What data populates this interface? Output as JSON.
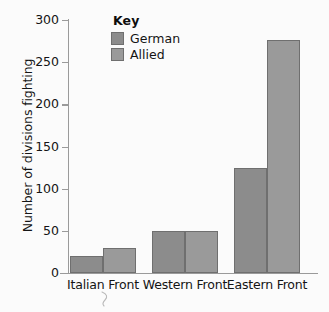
{
  "chart_data": {
    "type": "bar",
    "title": "",
    "subtitle": "",
    "xlabel": "",
    "ylabel": "Number of divisions fighting",
    "categories": [
      "Italian Front",
      "Western Front",
      "Eastern Front"
    ],
    "series": [
      {
        "name": "German",
        "color": "#8c8c8c",
        "values": [
          20,
          50,
          125
        ]
      },
      {
        "name": "Allied",
        "color": "#9a9a9a",
        "values": [
          30,
          50,
          276
        ]
      }
    ],
    "ylim": [
      0,
      300
    ],
    "ytick_values": [
      0,
      50,
      100,
      150,
      200,
      250,
      300
    ],
    "ytick_labels": [
      "0",
      "50",
      "100",
      "150",
      "200",
      "250",
      "300"
    ],
    "grid": false,
    "legend_position": "top-center",
    "legend_title": "Key",
    "bar_border_color": "#6f6f6f",
    "axis_color": "#9a9a9a",
    "background_color": "#fbfbfb",
    "text_color": "#141414"
  },
  "legend": {
    "title": "Key",
    "entries": [
      {
        "label": "German",
        "color": "#8c8c8c"
      },
      {
        "label": "Allied",
        "color": "#9a9a9a"
      }
    ]
  },
  "axes": {
    "y_title": "Number of divisions fighting",
    "y_ticks": [
      "300",
      "250",
      "200",
      "150",
      "100",
      "50",
      "0"
    ],
    "x_categories": [
      "Italian Front",
      "Western Front",
      "Eastern Front"
    ]
  }
}
